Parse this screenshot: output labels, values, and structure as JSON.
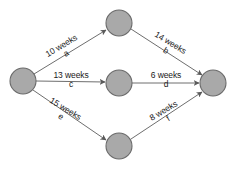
{
  "diagram": {
    "type": "activity-network-diagram",
    "background_color": "#ffffff",
    "node_fill_color": "#a9a9a9",
    "node_stroke_color": "#6a6a6a",
    "edge_color": "#6e6e6e",
    "text_color": "#1a1a1a",
    "nodes": [
      {
        "id": "start",
        "label": "",
        "cx": 23,
        "cy": 81,
        "r": 13
      },
      {
        "id": "top",
        "label": "",
        "cx": 119,
        "cy": 23,
        "r": 13
      },
      {
        "id": "middle",
        "label": "",
        "cx": 119,
        "cy": 83,
        "r": 13
      },
      {
        "id": "bottom",
        "label": "",
        "cx": 119,
        "cy": 146,
        "r": 13
      },
      {
        "id": "end",
        "label": "",
        "cx": 213,
        "cy": 83,
        "r": 13
      }
    ],
    "edges": [
      {
        "id": "a",
        "from": "start",
        "to": "top",
        "duration": "10 weeks",
        "activity": "a",
        "label_x": 64,
        "label_y": 50,
        "label_rotation": -31
      },
      {
        "id": "b",
        "from": "top",
        "to": "end",
        "duration": "14 weeks",
        "activity": "b",
        "label_x": 168,
        "label_y": 47,
        "label_rotation": 31
      },
      {
        "id": "c",
        "from": "start",
        "to": "middle",
        "duration": "13 weeks",
        "activity": "c",
        "label_x": 71,
        "label_y": 80,
        "label_rotation": 0
      },
      {
        "id": "d",
        "from": "middle",
        "to": "end",
        "duration": "6 weeks",
        "activity": "d",
        "label_x": 166,
        "label_y": 80,
        "label_rotation": 0
      },
      {
        "id": "e",
        "from": "start",
        "to": "bottom",
        "duration": "15 weeks",
        "activity": "e",
        "label_x": 63,
        "label_y": 113,
        "label_rotation": 31
      },
      {
        "id": "f",
        "from": "bottom",
        "to": "end",
        "duration": "8 weeks",
        "activity": "f",
        "label_x": 166,
        "label_y": 115,
        "label_rotation": -31
      }
    ]
  }
}
